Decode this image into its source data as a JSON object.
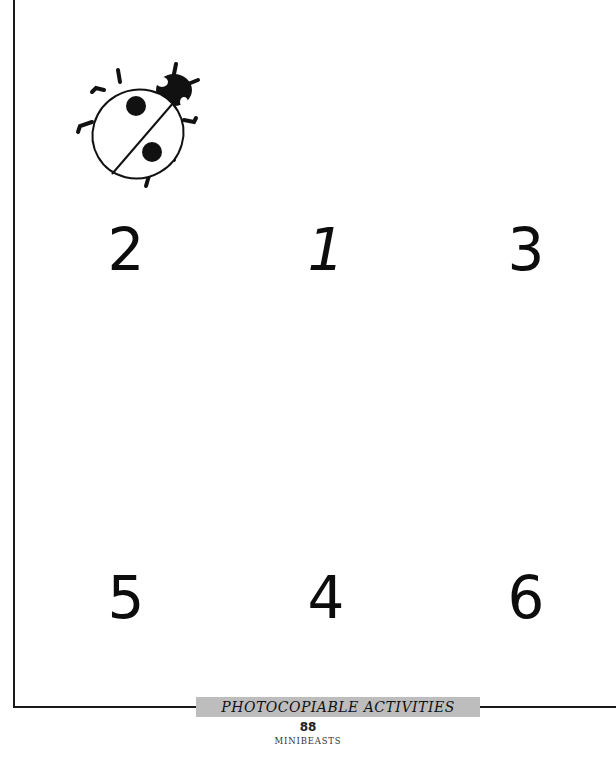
{
  "page": {
    "numbers_row_top": [
      "2",
      "1",
      "3"
    ],
    "numbers_row_bottom": [
      "5",
      "4",
      "6"
    ]
  },
  "illustration": {
    "icon": "ladybird-icon"
  },
  "footer": {
    "banner_label": "PHOTOCOPIABLE ACTIVITIES",
    "page_number": "88",
    "section": "MINIBEASTS"
  },
  "colors": {
    "ink": "#111111",
    "banner_gray": "#bdbdbd",
    "frame": "#1a1a1a"
  }
}
